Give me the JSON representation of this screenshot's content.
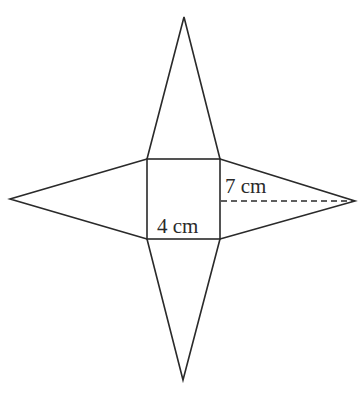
{
  "diagram": {
    "square": {
      "x1": 147,
      "y1": 159,
      "x2": 220,
      "y2": 239,
      "side_label": "4 cm"
    },
    "apexes": {
      "top": [
        184,
        17
      ],
      "bottom": [
        183,
        380
      ],
      "left": [
        10,
        199
      ],
      "right": [
        355,
        201
      ]
    },
    "height_line": {
      "from": [
        220,
        201
      ],
      "to": [
        355,
        201
      ],
      "style": "dashed",
      "label": "7 cm"
    },
    "colors": {
      "line": "#2a2a2a",
      "background": "#ffffff"
    }
  }
}
